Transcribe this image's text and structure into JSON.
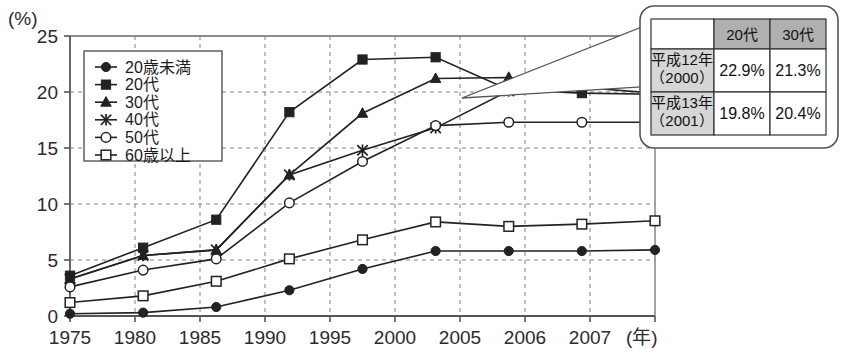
{
  "chart_data": {
    "type": "line",
    "title": "",
    "subtitle": "",
    "unit_label": "(%)",
    "xlabel": "(年)",
    "ylabel": "",
    "grid": true,
    "legend_position": "inside-top-left",
    "xlim": [
      0,
      8
    ],
    "ylim": [
      0,
      25
    ],
    "yticks": [
      0,
      5,
      10,
      15,
      20,
      25
    ],
    "categories": [
      "1975",
      "1980",
      "1985",
      "1990",
      "1995",
      "2000",
      "2005",
      "2006",
      "2007"
    ],
    "series": [
      {
        "name": "20歳未満",
        "marker": "filled-circle",
        "values": [
          0.2,
          0.3,
          0.8,
          2.3,
          4.2,
          5.8,
          5.8,
          5.8,
          5.9
        ]
      },
      {
        "name": "20代",
        "marker": "filled-square",
        "values": [
          3.6,
          6.1,
          8.6,
          18.2,
          22.9,
          23.1,
          20.2,
          19.9,
          19.8
        ]
      },
      {
        "name": "30代",
        "marker": "filled-triangle",
        "values": [
          3.3,
          5.4,
          5.9,
          12.6,
          18.1,
          21.2,
          21.3,
          20.4,
          19.9
        ]
      },
      {
        "name": "40代",
        "marker": "cross-star",
        "values": [
          3.3,
          5.4,
          5.9,
          12.6,
          14.8,
          16.8,
          20.1,
          20.5,
          20.6
        ]
      },
      {
        "name": "50代",
        "marker": "open-circle",
        "values": [
          2.6,
          4.1,
          5.1,
          10.1,
          13.8,
          17.0,
          17.3,
          17.3,
          17.3
        ]
      },
      {
        "name": "60歳以上",
        "marker": "open-square",
        "values": [
          1.2,
          1.8,
          3.1,
          5.1,
          6.8,
          8.4,
          8.0,
          8.2,
          8.5
        ]
      }
    ],
    "annotation_table": {
      "column_headers": [
        "",
        "20代",
        "30代"
      ],
      "rows": [
        {
          "label_line1": "平成12年",
          "label_line2": "（2000）",
          "values": [
            "22.9%",
            "21.3%"
          ]
        },
        {
          "label_line1": "平成13年",
          "label_line2": "（2001）",
          "values": [
            "19.8%",
            "20.4%"
          ]
        }
      ],
      "points_to_category": "2005"
    }
  },
  "colors": {
    "ink": "#1a1a1a",
    "axis": "#555555",
    "grid": "#777777",
    "series_line": "#222222",
    "table_header_fill": "#b0b0b0",
    "table_rowlabel_fill": "#d6d6d6",
    "background": "#ffffff"
  }
}
